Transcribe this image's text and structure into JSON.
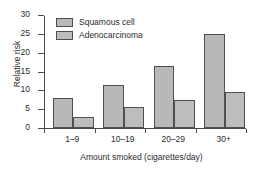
{
  "chart_data": {
    "type": "bar",
    "title": "",
    "xlabel": "Amount smoked (cigarettes/day)",
    "ylabel": "Relative risk",
    "categories": [
      "1–9",
      "10–19",
      "20–29",
      "30+"
    ],
    "series": [
      {
        "name": "Squamous cell",
        "values": [
          8,
          11.5,
          16.5,
          25
        ],
        "color": "#b8b8b8"
      },
      {
        "name": "Adenocarcinoma",
        "values": [
          3,
          5.5,
          7.5,
          9.5
        ],
        "color": "#bdbdbd"
      }
    ],
    "ylim": [
      0,
      30
    ],
    "yticks": [
      0,
      5,
      10,
      15,
      20,
      25,
      30
    ],
    "ytick_labels": [
      "0",
      "5",
      "10",
      "15",
      "20",
      "25",
      "30"
    ],
    "grid": false,
    "legend_position": "top-left",
    "bar_edge_color": "#4f4f4f",
    "axis_color": "#4a4a4a",
    "text_color": "#2b2b2b",
    "background": "#ffffff"
  }
}
